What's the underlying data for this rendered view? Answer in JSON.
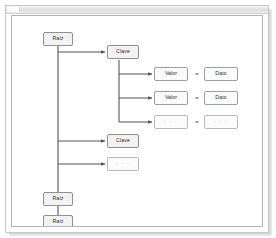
{
  "window": {
    "title_strip": "",
    "frame_color": "#c9c9c9",
    "canvas_border_color": "#b4b4b4",
    "background": "#ffffff"
  },
  "diagram": {
    "type": "tree",
    "line_color": "#555555",
    "node_fill": "#f2f2f2",
    "node_border": "#8f8f8f",
    "placeholder_text": "· · ·",
    "equals_symbol": "=",
    "nodes": {
      "root_top": {
        "label": "Raíz"
      },
      "key_1": {
        "label": "Clave"
      },
      "key_2": {
        "label": "Clave"
      },
      "key_more": {
        "label": "· · ·"
      },
      "root_2": {
        "label": "Raíz"
      },
      "root_3": {
        "label": "Raíz"
      },
      "root_4": {
        "label": ""
      }
    },
    "pairs": [
      {
        "value": {
          "label": "Valor"
        },
        "equals": "=",
        "data": {
          "label": "Dato"
        },
        "style": "solid"
      },
      {
        "value": {
          "label": "Valor"
        },
        "equals": "=",
        "data": {
          "label": "Dato"
        },
        "style": "solid"
      },
      {
        "value": {
          "label": "· · ·"
        },
        "equals": "=",
        "data": {
          "label": "· · ·"
        },
        "style": "light"
      }
    ]
  }
}
